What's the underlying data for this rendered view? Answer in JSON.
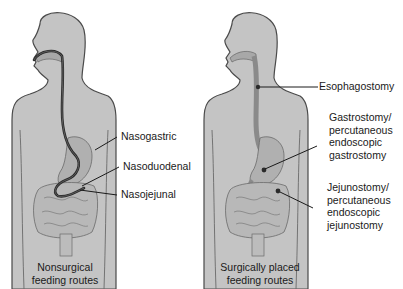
{
  "figure": {
    "colors": {
      "body_fill": "#c4c4c4",
      "body_outline": "#4a4a4a",
      "organ_fill": "#b4b4b4",
      "tube": "#2a2a2a",
      "leader": "#1a1a1a"
    },
    "left_panel": {
      "caption_line1": "Nonsurgical",
      "caption_line2": "feeding routes",
      "labels": [
        {
          "text": "Nasogastric"
        },
        {
          "text": "Nasoduodenal"
        },
        {
          "text": "Nasojejunal"
        }
      ]
    },
    "right_panel": {
      "caption_line1": "Surgically placed",
      "caption_line2": "feeding routes",
      "labels": [
        {
          "lines": [
            "Esophagostomy"
          ]
        },
        {
          "lines": [
            "Gastrostomy/",
            "percutaneous",
            "endoscopic",
            "gastrostomy"
          ]
        },
        {
          "lines": [
            "Jejunostomy/",
            "percutaneous",
            "endoscopic",
            "jejunostomy"
          ]
        }
      ]
    }
  }
}
